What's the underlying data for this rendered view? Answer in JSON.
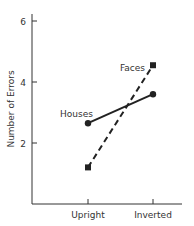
{
  "chart_data": {
    "type": "line",
    "title": "",
    "xlabel": "",
    "ylabel": "Number of Errors",
    "categories": [
      "Upright",
      "Inverted"
    ],
    "series": [
      {
        "name": "Houses",
        "values": [
          2.65,
          3.6
        ],
        "style": "solid",
        "marker": "circle"
      },
      {
        "name": "Faces",
        "values": [
          1.2,
          4.55
        ],
        "style": "dashed",
        "marker": "square"
      }
    ],
    "yticks": [
      2,
      4,
      6
    ],
    "ylim": [
      0,
      6.4
    ],
    "grid": false,
    "legend": "inline labels"
  },
  "colors": {
    "line": "#222222",
    "axis": "#333333",
    "text": "#333333"
  }
}
